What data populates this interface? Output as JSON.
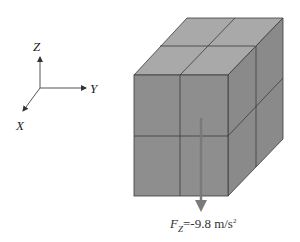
{
  "axes": {
    "z_label": "Z",
    "y_label": "Y",
    "x_label": "X"
  },
  "cube": {
    "description": "2x2x2 stacked cubes",
    "colors": {
      "front": "#8e8e8e",
      "top": "#a9a9a9",
      "side": "#8a8a8a",
      "edge": "#3a3a3a"
    }
  },
  "force": {
    "symbol": "F",
    "subscript": "Z",
    "value": "=-9.8 m/s",
    "exponent": "2",
    "arrow_color": "#7a7a7a"
  }
}
